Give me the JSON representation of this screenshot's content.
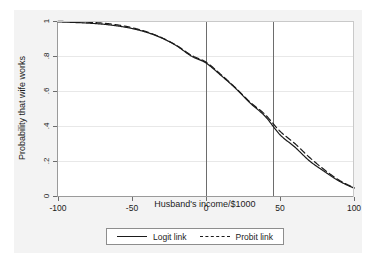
{
  "chart_data": {
    "type": "line",
    "title": "",
    "xlabel": "Husband's income/$1000",
    "ylabel": "Probability that wife works",
    "xlim": [
      -100,
      100
    ],
    "ylim": [
      0,
      1
    ],
    "xticks": [
      "-100",
      "-50",
      "0",
      "50",
      "100"
    ],
    "xtick_values": [
      -100,
      -50,
      0,
      50,
      100
    ],
    "yticks": [
      "0",
      ".2",
      ".4",
      ".6",
      ".8",
      "1"
    ],
    "ytick_values": [
      0,
      0.2,
      0.4,
      0.6,
      0.8,
      1
    ],
    "grid": "horizontal",
    "legend_position": "bottom",
    "x": [
      -100,
      -90,
      -80,
      -70,
      -60,
      -50,
      -40,
      -30,
      -20,
      -10,
      0,
      10,
      20,
      30,
      40,
      50,
      60,
      70,
      80,
      90,
      100
    ],
    "series": [
      {
        "name": "Logit link",
        "style": "solid",
        "color": "#1b1b1b",
        "values": [
          0.995,
          0.992,
          0.988,
          0.982,
          0.972,
          0.957,
          0.935,
          0.903,
          0.859,
          0.8,
          0.76,
          0.69,
          0.615,
          0.53,
          0.455,
          0.35,
          0.28,
          0.2,
          0.14,
          0.085,
          0.045
        ]
      },
      {
        "name": "Probit link",
        "style": "dashed",
        "color": "#1b1b1b",
        "values": [
          0.998,
          0.996,
          0.993,
          0.988,
          0.978,
          0.962,
          0.938,
          0.905,
          0.861,
          0.805,
          0.765,
          0.695,
          0.618,
          0.535,
          0.465,
          0.37,
          0.3,
          0.22,
          0.15,
          0.09,
          0.047
        ]
      }
    ],
    "reference_lines": [
      {
        "name": "vline-zero",
        "orientation": "vertical",
        "x": 0
      },
      {
        "name": "vline-mean",
        "orientation": "vertical",
        "x": 45
      }
    ]
  },
  "legend": {
    "entries": [
      {
        "label": "Logit link",
        "style": "solid"
      },
      {
        "label": "Probit link",
        "style": "dashed"
      }
    ]
  },
  "colors": {
    "background": "#f3f3f3",
    "plot_background": "#ffffff",
    "line": "#1b1b1b",
    "grid": "#e8e8e8",
    "axis": "#6d6d6d"
  }
}
